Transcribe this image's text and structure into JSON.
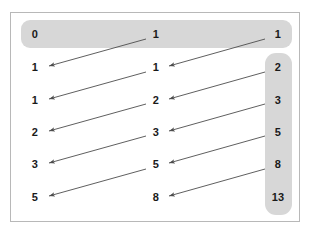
{
  "diagram": {
    "frame": {
      "border_color": "#b8b8b8",
      "background": "#ffffff"
    },
    "band_color": "#d7d7d7",
    "arrow_color": "#4d4d4d",
    "columns": [
      {
        "name": "left",
        "values": [
          "0",
          "1",
          "1",
          "2",
          "3",
          "5"
        ]
      },
      {
        "name": "middle",
        "values": [
          "1",
          "1",
          "2",
          "3",
          "5",
          "8"
        ]
      },
      {
        "name": "right",
        "values": [
          "1",
          "2",
          "3",
          "5",
          "8",
          "13"
        ]
      }
    ],
    "highlight_bands": [
      {
        "name": "top-row-band",
        "contains": [
          "0",
          "1",
          "1"
        ]
      },
      {
        "name": "right-column-band",
        "contains": [
          "2",
          "3",
          "5",
          "8",
          "13"
        ]
      }
    ],
    "arrows": [
      {
        "from": "middle.0",
        "to": "left.1",
        "direction": "down-left"
      },
      {
        "from": "middle.1",
        "to": "left.2",
        "direction": "down-left"
      },
      {
        "from": "middle.2",
        "to": "left.3",
        "direction": "down-left"
      },
      {
        "from": "middle.3",
        "to": "left.4",
        "direction": "down-left"
      },
      {
        "from": "middle.4",
        "to": "left.5",
        "direction": "down-left"
      },
      {
        "from": "right.0",
        "to": "middle.1",
        "direction": "down-left"
      },
      {
        "from": "right.1",
        "to": "middle.2",
        "direction": "down-left"
      },
      {
        "from": "right.2",
        "to": "middle.3",
        "direction": "down-left"
      },
      {
        "from": "right.3",
        "to": "middle.4",
        "direction": "down-left"
      },
      {
        "from": "right.4",
        "to": "middle.5",
        "direction": "down-left"
      }
    ]
  }
}
